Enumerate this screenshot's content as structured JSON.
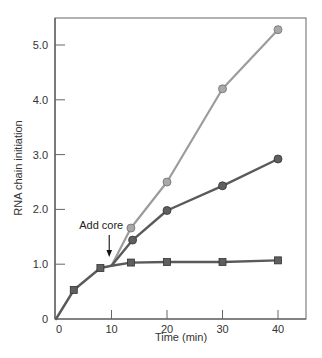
{
  "chart_data": {
    "type": "line",
    "title": "",
    "xlabel": "Time (min)",
    "ylabel": "RNA chain initiation",
    "xlim": [
      0,
      45
    ],
    "ylim": [
      0,
      5.6
    ],
    "x_ticks": [
      0,
      10,
      20,
      30,
      40
    ],
    "x_tick_labels": [
      "0",
      "10",
      "20",
      "30",
      "40"
    ],
    "y_ticks": [
      0,
      1.0,
      2.0,
      3.0,
      4.0,
      5.0
    ],
    "y_tick_labels": [
      "0",
      "1.0",
      "2.0",
      "3.0",
      "4.0",
      "5.0"
    ],
    "grid": false,
    "legend": null,
    "annotations": [
      {
        "text": "Add core",
        "x": 9.5,
        "y": 1.0,
        "arrow": "down"
      }
    ],
    "series": [
      {
        "name": "before core addition",
        "marker": "square",
        "color": "#5a5a5a",
        "line_color": "#5a5a5a",
        "x": [
          0,
          3.2,
          8,
          10
        ],
        "y": [
          0,
          0.53,
          0.93,
          0.97
        ]
      },
      {
        "name": "no core (plateau)",
        "marker": "square",
        "color": "#5a5a5a",
        "line_color": "#5a5a5a",
        "x": [
          10,
          13.5,
          20,
          30,
          40
        ],
        "y": [
          0.97,
          1.03,
          1.04,
          1.04,
          1.07
        ]
      },
      {
        "name": "core added (intermediate)",
        "marker": "circle",
        "color": "#5a5a5a",
        "line_color": "#5a5a5a",
        "x": [
          10,
          13.8,
          20,
          30,
          40
        ],
        "y": [
          0.97,
          1.44,
          1.98,
          2.43,
          2.92
        ]
      },
      {
        "name": "core added (high)",
        "marker": "circle",
        "color": "#a6a6a6",
        "line_color": "#9c9c9c",
        "x": [
          10,
          13.5,
          20,
          30,
          40
        ],
        "y": [
          0.97,
          1.66,
          2.5,
          4.2,
          5.28
        ]
      }
    ]
  },
  "layout": {
    "plot_left": 56,
    "plot_right": 306,
    "plot_top": 18,
    "plot_bottom": 319,
    "px_per_min": 5.55,
    "px_per_unit": 54.8
  },
  "colors": {
    "axis": "#666666",
    "dark_line": "#5a5a5a",
    "dark_marker_fill": "#5f5f5f",
    "dark_marker_stroke": "#333333",
    "light_line": "#9c9c9c",
    "light_marker_fill": "#a8a8a8",
    "light_marker_stroke": "#6e6e6e"
  }
}
